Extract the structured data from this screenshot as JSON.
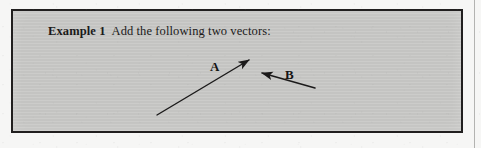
{
  "page": {
    "background_color": "#f6f6f5",
    "rule_color": "#b3b3b1"
  },
  "example_box": {
    "fill_color": "#c9c9c7",
    "border_color": "#211f1f",
    "heading": {
      "label": "Example 1",
      "text": "Add the following two vectors:"
    }
  },
  "figure": {
    "stroke_color": "#1b1a1a",
    "vectors": [
      {
        "name": "A",
        "label": "A",
        "tail": [
          155,
          113
        ],
        "tip": [
          250,
          57
        ],
        "arrowhead_at": "tip",
        "label_position": [
          197,
          49
        ]
      },
      {
        "name": "B",
        "label": "B",
        "tail": [
          313,
          86
        ],
        "tip": [
          256,
          70
        ],
        "arrowhead_at": "tip",
        "label_position": [
          272,
          57
        ]
      }
    ]
  }
}
